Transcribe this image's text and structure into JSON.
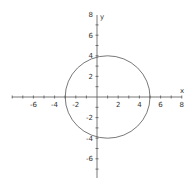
{
  "chart_data": {
    "type": "line",
    "title": "",
    "xlabel": "x",
    "ylabel": "y",
    "xlim": [
      -8,
      8
    ],
    "ylim": [
      -8,
      8
    ],
    "grid": false,
    "x_ticks": [
      -6,
      -4,
      -2,
      2,
      4,
      6,
      8
    ],
    "y_ticks": [
      8,
      6,
      4,
      2,
      -2,
      -4,
      -6
    ],
    "x_tick_labels": [
      "-6",
      "-4",
      "-2",
      "2",
      "4",
      "6",
      "8"
    ],
    "y_tick_labels": [
      "8",
      "6",
      "4",
      "2",
      "-2",
      "-4",
      "-6"
    ],
    "series": [
      {
        "name": "circle",
        "shape": "circle",
        "center": [
          1,
          0
        ],
        "radius": 4,
        "equation": "(x-1)^2 + y^2 = 16",
        "key_points": [
          [
            -3,
            0
          ],
          [
            5,
            0
          ],
          [
            1,
            4
          ],
          [
            1,
            -4
          ]
        ]
      }
    ],
    "colors": {
      "axis": "#555555",
      "curve": "#555555"
    }
  }
}
